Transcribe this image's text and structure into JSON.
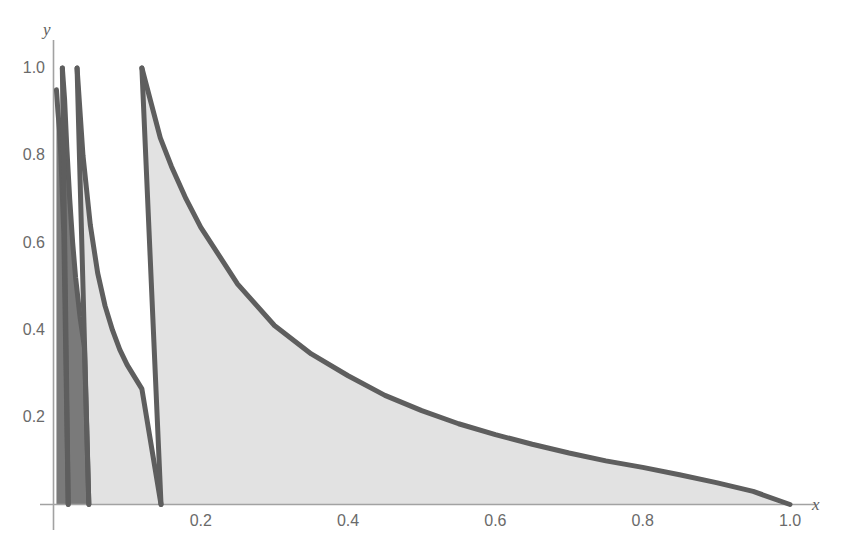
{
  "figure": {
    "background": "#ffffff",
    "axis_color": "#9a9a9a",
    "curve_color": "#5e5e5e",
    "fill_light": "#e2e2e2",
    "fill_dark": "#7a7a7a",
    "x_axis_label": "x",
    "y_axis_label": "y"
  },
  "chart_data": {
    "type": "line",
    "title": "",
    "xlabel": "x",
    "ylabel": "y",
    "xlim": [
      0.0,
      1.06
    ],
    "ylim": [
      0.0,
      1.06
    ],
    "grid": false,
    "legend": "none",
    "xticks": [
      0.2,
      0.4,
      0.6,
      0.8,
      1.0
    ],
    "xticklabels": [
      "0.2",
      "0.4",
      "0.6",
      "0.8",
      "1.0"
    ],
    "yticks": [
      0.2,
      0.4,
      0.6,
      0.8,
      1.0
    ],
    "yticklabels": [
      "0.2",
      "0.4",
      "0.6",
      "0.8",
      "1.0"
    ],
    "series": [
      {
        "name": "region-1-outer",
        "fill": "#e2e2e2",
        "k": 0.12,
        "x_start": 0.12,
        "x_end": 1.0,
        "x": [
          0.12,
          0.145,
          0.16,
          0.18,
          0.2,
          0.25,
          0.3,
          0.35,
          0.4,
          0.45,
          0.5,
          0.55,
          0.6,
          0.65,
          0.7,
          0.75,
          0.8,
          0.85,
          0.9,
          0.95,
          1.0
        ],
        "y": [
          1.0,
          0.84,
          0.775,
          0.7,
          0.635,
          0.505,
          0.41,
          0.345,
          0.295,
          0.25,
          0.215,
          0.185,
          0.16,
          0.138,
          0.118,
          0.1,
          0.085,
          0.068,
          0.05,
          0.03,
          0.0
        ],
        "left_boundary": {
          "x_top": 0.12,
          "y_top": 1.0,
          "x_bottom": 0.146,
          "y_bottom": 0.0
        }
      },
      {
        "name": "region-2",
        "fill": "#e2e2e2",
        "k": 0.032,
        "x_start": 0.032,
        "x_end": 0.146,
        "x": [
          0.032,
          0.04,
          0.05,
          0.06,
          0.07,
          0.08,
          0.09,
          0.1,
          0.12,
          0.146
        ],
        "y": [
          1.0,
          0.8,
          0.64,
          0.53,
          0.455,
          0.4,
          0.355,
          0.32,
          0.265,
          0.0
        ],
        "left_boundary": {
          "x_top": 0.032,
          "y_top": 1.0,
          "x_bottom": 0.048,
          "y_bottom": 0.0
        }
      },
      {
        "name": "region-3-dark",
        "fill": "#7a7a7a",
        "k": 0.012,
        "x_start": 0.012,
        "x_end": 0.048,
        "x": [
          0.012,
          0.015,
          0.018,
          0.022,
          0.026,
          0.03,
          0.036,
          0.042,
          0.048
        ],
        "y": [
          1.0,
          0.93,
          0.82,
          0.7,
          0.6,
          0.52,
          0.43,
          0.36,
          0.0
        ],
        "left_boundary": {
          "x_top": 0.012,
          "y_top": 1.0,
          "x_bottom": 0.02,
          "y_bottom": 0.0
        }
      },
      {
        "name": "region-4-inner",
        "fill": "#7a7a7a",
        "k": 0.004,
        "x_start": 0.004,
        "x_end": 0.02,
        "x": [
          0.004,
          0.006,
          0.008,
          0.01,
          0.014,
          0.02
        ],
        "y": [
          0.95,
          0.9,
          0.86,
          0.8,
          0.62,
          0.0
        ]
      }
    ]
  }
}
